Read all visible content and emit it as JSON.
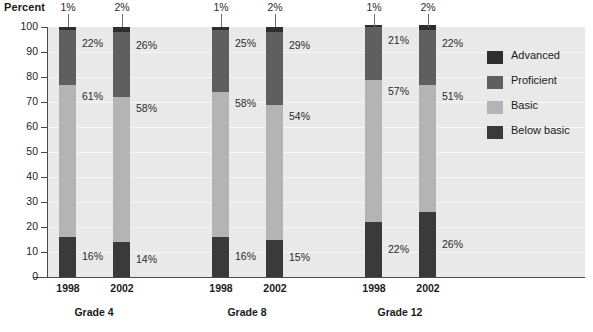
{
  "chart_data": {
    "type": "bar",
    "subtype": "stacked-bar-100",
    "title": "",
    "ylabel": "Percent",
    "xlabel": "",
    "ylim": [
      0,
      100
    ],
    "yticks": [
      0,
      10,
      20,
      30,
      40,
      50,
      60,
      70,
      80,
      90,
      100
    ],
    "grid": true,
    "legend_position": "right",
    "groups": [
      "Grade 4",
      "Grade 8",
      "Grade 12"
    ],
    "categories": [
      "1998",
      "2002",
      "1998",
      "2002",
      "1998",
      "2002"
    ],
    "series": [
      {
        "name": "Advanced",
        "color": "#2e2e2e",
        "values": [
          1,
          2,
          1,
          2,
          1,
          2
        ]
      },
      {
        "name": "Proficient",
        "color": "#5f5f5f",
        "values": [
          22,
          26,
          25,
          29,
          21,
          22
        ]
      },
      {
        "name": "Basic",
        "color": "#b4b4b4",
        "values": [
          61,
          58,
          58,
          54,
          57,
          51
        ]
      },
      {
        "name": "Below basic",
        "color": "#3a3a3a",
        "values": [
          16,
          14,
          16,
          15,
          22,
          26
        ]
      }
    ],
    "bars": [
      {
        "group": "Grade 4",
        "year": "1998",
        "advanced": "1%",
        "proficient": "22%",
        "basic": "61%",
        "below_basic": "16%"
      },
      {
        "group": "Grade 4",
        "year": "2002",
        "advanced": "2%",
        "proficient": "26%",
        "basic": "58%",
        "below_basic": "14%"
      },
      {
        "group": "Grade 8",
        "year": "1998",
        "advanced": "1%",
        "proficient": "25%",
        "basic": "58%",
        "below_basic": "16%"
      },
      {
        "group": "Grade 8",
        "year": "2002",
        "advanced": "2%",
        "proficient": "29%",
        "basic": "54%",
        "below_basic": "15%"
      },
      {
        "group": "Grade 12",
        "year": "1998",
        "advanced": "1%",
        "proficient": "21%",
        "basic": "57%",
        "below_basic": "22%"
      },
      {
        "group": "Grade 12",
        "year": "2002",
        "advanced": "2%",
        "proficient": "22%",
        "basic": "51%",
        "below_basic": "26%"
      }
    ]
  },
  "axis": {
    "y_title": "Percent",
    "y_ticks": [
      "100",
      "90",
      "80",
      "70",
      "60",
      "50",
      "40",
      "30",
      "20",
      "10",
      "0"
    ]
  },
  "x_axis": {
    "years": [
      "1998",
      "2002",
      "1998",
      "2002",
      "1998",
      "2002"
    ],
    "groups": [
      "Grade 4",
      "Grade 8",
      "Grade 12"
    ]
  },
  "bar_labels": [
    {
      "cap": "1%",
      "proficient": "22%",
      "basic": "61%",
      "below": "16%"
    },
    {
      "cap": "2%",
      "proficient": "26%",
      "basic": "58%",
      "below": "14%"
    },
    {
      "cap": "1%",
      "proficient": "25%",
      "basic": "58%",
      "below": "16%"
    },
    {
      "cap": "2%",
      "proficient": "29%",
      "basic": "54%",
      "below": "15%"
    },
    {
      "cap": "1%",
      "proficient": "21%",
      "basic": "57%",
      "below": "22%"
    },
    {
      "cap": "2%",
      "proficient": "22%",
      "basic": "51%",
      "below": "26%"
    }
  ],
  "legend": {
    "items": [
      {
        "label": "Advanced",
        "color": "#2e2e2e"
      },
      {
        "label": "Proficient",
        "color": "#5f5f5f"
      },
      {
        "label": "Basic",
        "color": "#b4b4b4"
      },
      {
        "label": "Below basic",
        "color": "#3a3a3a"
      }
    ]
  }
}
